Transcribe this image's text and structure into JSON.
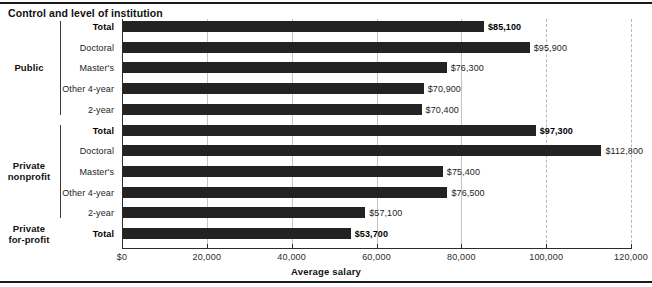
{
  "header": {
    "title": "Control and level of institution"
  },
  "chart_data": {
    "type": "bar",
    "orientation": "horizontal",
    "title": "Control and level of institution",
    "xlabel": "Average salary",
    "ylabel": "",
    "xlim": [
      0,
      120000
    ],
    "grid": true,
    "legend": null,
    "tick_labels": [
      "$0",
      "20,000",
      "40,000",
      "60,000",
      "80,000",
      "100,000",
      "120,000"
    ],
    "tick_values": [
      0,
      20000,
      40000,
      60000,
      80000,
      100000,
      120000
    ],
    "groups": [
      {
        "name": "Public",
        "categories": [
          "Total",
          "Doctoral",
          "Master's",
          "Other 4-year",
          "2-year"
        ],
        "values": [
          85100,
          95900,
          76300,
          70900,
          70400
        ],
        "value_labels": [
          "$85,100",
          "$95,900",
          "$76,300",
          "$70,900",
          "$70,400"
        ],
        "emphasis": [
          true,
          false,
          false,
          false,
          false
        ]
      },
      {
        "name": "Private nonprofit",
        "categories": [
          "Total",
          "Doctoral",
          "Master's",
          "Other 4-year",
          "2-year"
        ],
        "values": [
          97300,
          112800,
          75400,
          76500,
          57100
        ],
        "value_labels": [
          "$97,300",
          "$112,800",
          "$75,400",
          "$76,500",
          "$57,100"
        ],
        "emphasis": [
          true,
          false,
          false,
          false,
          false
        ]
      },
      {
        "name": "Private for-profit",
        "categories": [
          "Total"
        ],
        "values": [
          53700
        ],
        "value_labels": [
          "$53,700"
        ],
        "emphasis": [
          true
        ]
      }
    ]
  },
  "group_labels": {
    "public": "Public",
    "private_nonprofit_line1": "Private",
    "private_nonprofit_line2": "nonprofit",
    "private_forprofit_line1": "Private",
    "private_forprofit_line2": "for-profit"
  },
  "rows": [
    {
      "label": "Total",
      "value_label": "$85,100",
      "total": true
    },
    {
      "label": "Doctoral",
      "value_label": "$95,900",
      "total": false
    },
    {
      "label": "Master's",
      "value_label": "$76,300",
      "total": false
    },
    {
      "label": "Other 4-year",
      "value_label": "$70,900",
      "total": false
    },
    {
      "label": "2-year",
      "value_label": "$70,400",
      "total": false
    },
    {
      "label": "Total",
      "value_label": "$97,300",
      "total": true
    },
    {
      "label": "Doctoral",
      "value_label": "$112,800",
      "total": false
    },
    {
      "label": "Master's",
      "value_label": "$75,400",
      "total": false
    },
    {
      "label": "Other 4-year",
      "value_label": "$76,500",
      "total": false
    },
    {
      "label": "2-year",
      "value_label": "$57,100",
      "total": false
    },
    {
      "label": "Total",
      "value_label": "$53,700",
      "total": true
    }
  ],
  "axis": {
    "title": "Average salary",
    "ticks": [
      "$0",
      "20,000",
      "40,000",
      "60,000",
      "80,000",
      "100,000",
      "120,000"
    ]
  },
  "colors": {
    "bar": "#232323",
    "grid": "#b8b8b8",
    "axis": "#2b2b2b",
    "text": "#1d1d1d"
  }
}
